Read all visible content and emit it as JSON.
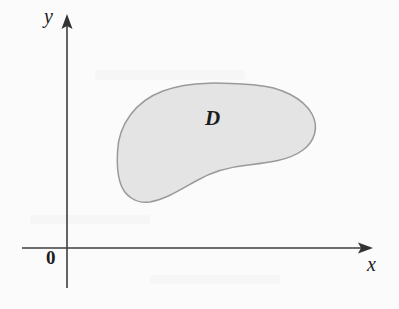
{
  "figure": {
    "kind": "coordinate-plane-region-diagram",
    "background_color": "#fbfbfb",
    "width": 399,
    "height": 309
  },
  "axes": {
    "x_axis": {
      "label": "x",
      "color": "#3f3f3f",
      "start_x": 22,
      "end_x": 373,
      "y": 248,
      "arrow": "right"
    },
    "y_axis": {
      "label": "y",
      "color": "#3f3f3f",
      "x": 67,
      "start_y": 288,
      "end_y": 14,
      "arrow": "up"
    },
    "origin_label": "0"
  },
  "region": {
    "label": "D",
    "fill_color": "#e4e4e4",
    "stroke_color": "#9a9a9a",
    "label_x": 213,
    "label_y": 120,
    "path": "M 117.5 152 C 118.5 124 136 101 163 91 C 192 80 228 83 255 85 C 281 87 303 98 312 114 C 319 127 315 141 303 150 C 288 161 266 163 248 165 C 228 167 211 172 196 181 C 180 190 166 199 150 202 C 136 204 124 196 120 182 C 117 172 117 161 117.5 152 Z"
  }
}
